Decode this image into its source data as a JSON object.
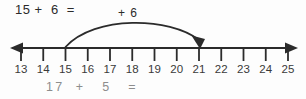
{
  "worksheet": {
    "width": 306,
    "height": 99,
    "background_color": "#fdfdfd",
    "ink_color": "#2b2b2b",
    "faded_ink_color": "#8d8d8d"
  },
  "equations": {
    "top": "15 +  6  =",
    "bottom": "17  +   5   ="
  },
  "jump": {
    "label": "+ 6",
    "from_value": 15,
    "to_value": 21,
    "amount": 6
  },
  "numberline": {
    "start_value": 13,
    "end_value": 25,
    "labels": [
      "13",
      "14",
      "15",
      "16",
      "17",
      "18",
      "19",
      "20",
      "21",
      "22",
      "23",
      "24",
      "25"
    ],
    "first_tick_x": 21,
    "spacing": 22.25,
    "axis_y": 48,
    "tick_height": 13,
    "left_arrow": "left-arrowhead",
    "right_arrow": "right-arrowhead"
  }
}
